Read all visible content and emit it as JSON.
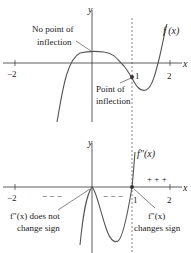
{
  "top_graph": {
    "y_axis_label": "y",
    "x_axis_label": "x",
    "tick_labels": {
      "neg2": "−2",
      "one": "1",
      "two": "2"
    },
    "curve_label": "f (x)",
    "annotation_no_inflection": {
      "line1": "No point of",
      "line2": "inflection"
    },
    "annotation_inflection": {
      "line1": "Point of",
      "line2": "inflection"
    }
  },
  "bottom_graph": {
    "y_axis_label": "y",
    "x_axis_label": "x",
    "tick_labels": {
      "neg2": "−2",
      "one": "1",
      "two": "2"
    },
    "curve_label": "f″(x)",
    "sign_left": "− − −",
    "sign_middle": "− − −",
    "sign_right": "+ + +",
    "annotation_no_change": {
      "line1": "f″(x) does not",
      "line2": "change sign"
    },
    "annotation_change": {
      "line1": "f″(x)",
      "line2": "changes sign"
    }
  },
  "colors": {
    "curve": "#555555",
    "axis": "#333333",
    "dashed": "#555555",
    "text": "#222222"
  }
}
